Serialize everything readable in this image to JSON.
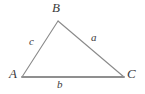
{
  "figure": {
    "kind": "geometry-diagram",
    "shape": "triangle",
    "background_color": "#ffffff",
    "stroke_color_base": "#8c8c8c",
    "stroke_color_sides": "#7a7a7a",
    "label_color": "#3b3b3b",
    "canvas": {
      "width": 145,
      "height": 94
    },
    "vertices": [
      {
        "name": "A",
        "label": "A",
        "x": 22,
        "y": 77
      },
      {
        "name": "B",
        "label": "B",
        "x": 58,
        "y": 21
      },
      {
        "name": "C",
        "label": "C",
        "x": 124,
        "y": 77
      }
    ],
    "sides": [
      {
        "name": "side-c",
        "label": "c",
        "from": "A",
        "to": "B"
      },
      {
        "name": "side-a",
        "label": "a",
        "from": "B",
        "to": "C"
      },
      {
        "name": "side-b",
        "label": "b",
        "from": "A",
        "to": "C"
      }
    ]
  }
}
